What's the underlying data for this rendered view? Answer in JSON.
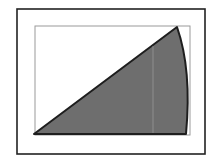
{
  "diagram": {
    "colors": {
      "background": "#ffffff",
      "outer_frame": "#222222",
      "inner_frame": "#9a9a9a",
      "sector_fill": "#6e6e6e",
      "sector_stroke": "#1e1e1e",
      "guide_line": "#9c9c9c"
    },
    "outer_frame": {
      "x": 17,
      "y": 9,
      "width": 188,
      "height": 145
    },
    "inner_frame": {
      "x": 35,
      "y": 26,
      "width": 155,
      "height": 109
    },
    "sector": {
      "origin": [
        34,
        134
      ],
      "apex": [
        177,
        27
      ],
      "end": [
        186,
        134
      ],
      "arc_control": [
        192,
        70
      ]
    },
    "guide_line": {
      "x": 153,
      "y1": 46,
      "y2": 133
    }
  }
}
